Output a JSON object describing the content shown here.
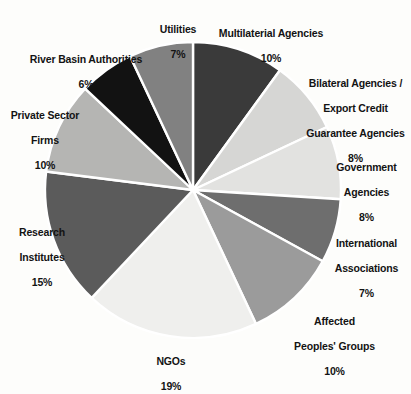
{
  "chart_data": {
    "type": "pie",
    "title": "",
    "subtitle": "",
    "xlabel": "",
    "ylabel": "",
    "legend_position": "none",
    "grid": false,
    "units": "percent",
    "label_format": "{name} {value}%",
    "start_angle_deg": 0,
    "direction": "clockwise",
    "categories": [
      "Multilaterial Agencies",
      "Bilateral Agencies / Export Credit Guarantee Agencies",
      "Government Agencies",
      "International Associations",
      "Affected Peoples' Groups",
      "NGOs",
      "Research Institutes",
      "Private Sector Firms",
      "River Basin Authorities",
      "Utilities"
    ],
    "values": [
      10,
      8,
      8,
      7,
      10,
      19,
      15,
      10,
      6,
      7
    ],
    "slices": [
      {
        "id": "multilateral-agencies",
        "name": "Multilaterial Agencies",
        "name_line1": "Multilaterial Agencies",
        "value": 10,
        "value_label": "10%",
        "color": "#3a3a3a"
      },
      {
        "id": "bilateral-agencies",
        "name": "Bilateral Agencies / Export Credit Guarantee Agencies",
        "name_line1": "Bilateral Agencies /",
        "name_line2": "Export Credit",
        "name_line3": "Guarantee Agencies",
        "value": 8,
        "value_label": "8%",
        "color": "#d6d6d4"
      },
      {
        "id": "government-agencies",
        "name": "Government Agencies",
        "name_line1": "Government",
        "name_line2": "Agencies",
        "value": 8,
        "value_label": "8%",
        "color": "#e2e2e0"
      },
      {
        "id": "international-associations",
        "name": "International Associations",
        "name_line1": "International",
        "name_line2": "Associations",
        "value": 7,
        "value_label": "7%",
        "color": "#6e6e6e"
      },
      {
        "id": "affected-peoples-groups",
        "name": "Affected Peoples' Groups",
        "name_line1": "Affected",
        "name_line2": "Peoples' Groups",
        "value": 10,
        "value_label": "10%",
        "color": "#9b9b9b"
      },
      {
        "id": "ngos",
        "name": "NGOs",
        "name_line1": "NGOs",
        "value": 19,
        "value_label": "19%",
        "color": "#efefed"
      },
      {
        "id": "research-institutes",
        "name": "Research Institutes",
        "name_line1": "Research",
        "name_line2": "Institutes",
        "value": 15,
        "value_label": "15%",
        "color": "#5b5b5b"
      },
      {
        "id": "private-sector-firms",
        "name": "Private Sector Firms",
        "name_line1": "Private Sector",
        "name_line2": "Firms",
        "value": 10,
        "value_label": "10%",
        "color": "#b5b5b3"
      },
      {
        "id": "river-basin-authorities",
        "name": "River Basin Authorities",
        "name_line1": "River Basin Authorities",
        "value": 6,
        "value_label": "6%",
        "color": "#121212"
      },
      {
        "id": "utilities",
        "name": "Utilities",
        "name_line1": "Utilities",
        "value": 7,
        "value_label": "7%",
        "color": "#818181"
      }
    ],
    "geometry": {
      "center_x": 193,
      "center_y": 190,
      "radius": 148,
      "separator_color": "#ffffff",
      "separator_width": 2.4
    },
    "colors": {
      "background": "#fdfdfb",
      "text": "#131313"
    }
  }
}
